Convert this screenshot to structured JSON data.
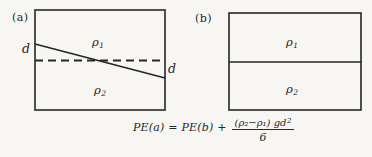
{
  "figure": {
    "colors": {
      "background": "#f7f6f2",
      "ink": "#262626"
    },
    "panel_a": {
      "label": "(a)",
      "upper_density_symbol": "ρ",
      "upper_density_sub": "1",
      "lower_density_symbol": "ρ",
      "lower_density_sub": "2",
      "d_left": "d",
      "d_right": "d"
    },
    "panel_b": {
      "label": "(b)",
      "upper_density_symbol": "ρ",
      "upper_density_sub": "1",
      "lower_density_symbol": "ρ",
      "lower_density_sub": "2"
    },
    "equation": {
      "lhs": "PE(a) = PE(b) +",
      "numerator": "(ρ₂−ρ₁) gd",
      "numerator_exponent": "2",
      "denominator": "6"
    }
  }
}
